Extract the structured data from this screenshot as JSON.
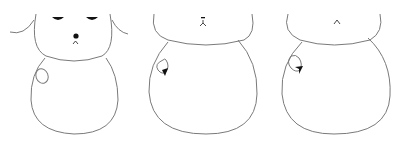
{
  "scene": {
    "description": "Three sequential line drawings of a snowman-shaped bear figure",
    "colors": {
      "background": "#ffffff",
      "outline": "#7a7a7a",
      "features": "#111111"
    }
  },
  "figures": [
    {
      "id": "figure-1",
      "features": [
        "ears",
        "eyes",
        "nose",
        "mouth",
        "arm-loop"
      ]
    },
    {
      "id": "figure-2",
      "features": [
        "mouth",
        "arm-loop",
        "arrow-head"
      ]
    },
    {
      "id": "figure-3",
      "features": [
        "mouth",
        "arm-loop",
        "arrow-head"
      ]
    }
  ]
}
